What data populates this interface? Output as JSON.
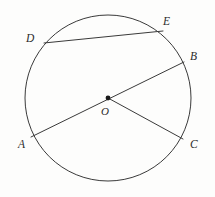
{
  "figure": {
    "type": "circle-geometry-diagram",
    "background_color": "#fdfdfc",
    "stroke_color": "#3a3a3a",
    "label_color": "#2b2b2b",
    "stroke_width": 1
  },
  "circle": {
    "name": "circle-O",
    "center_x": 108,
    "center_y": 98,
    "radius": 83
  },
  "center_point": {
    "name": "O",
    "x": 108,
    "y": 98,
    "dot_radius": 2.4
  },
  "points": {
    "A": {
      "label": "A",
      "x": 31,
      "y": 137,
      "label_x": 18,
      "label_y": 139
    },
    "B": {
      "label": "B",
      "x": 184,
      "y": 62,
      "label_x": 190,
      "label_y": 51
    },
    "C": {
      "label": "C",
      "x": 183,
      "y": 139,
      "label_x": 190,
      "label_y": 139
    },
    "D": {
      "label": "D",
      "x": 44,
      "y": 43,
      "label_x": 26,
      "label_y": 33
    },
    "E": {
      "label": "E",
      "x": 163,
      "y": 31,
      "label_x": 163,
      "label_y": 16
    },
    "O": {
      "label": "O",
      "x": 108,
      "y": 98,
      "label_x": 101,
      "label_y": 106
    }
  },
  "segments": [
    {
      "name": "chord-DE",
      "from": "D",
      "to": "E",
      "x1": 44,
      "y1": 43,
      "x2": 163,
      "y2": 31
    },
    {
      "name": "diameter-AB",
      "from": "A",
      "to": "B",
      "x1": 31,
      "y1": 137,
      "x2": 184,
      "y2": 62
    },
    {
      "name": "radius-OC",
      "from": "O",
      "to": "C",
      "x1": 108,
      "y1": 98,
      "x2": 183,
      "y2": 139
    }
  ],
  "labels_order": [
    "D",
    "E",
    "B",
    "O",
    "A",
    "C"
  ]
}
